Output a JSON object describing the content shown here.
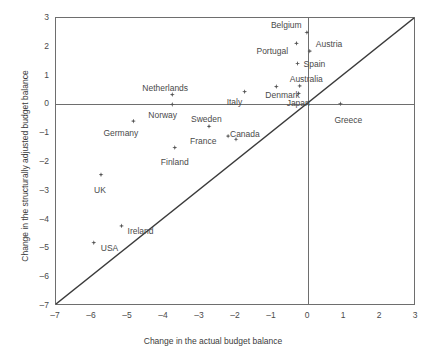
{
  "chart_data": {
    "type": "scatter",
    "title": "",
    "xlabel": "Change in the actual budget balance",
    "ylabel": "Change in the structurally adjusted budget balance",
    "xlim": [
      -7,
      3
    ],
    "ylim": [
      -7,
      3
    ],
    "xticks": [
      "-7",
      "-6",
      "-5",
      "-4",
      "-3",
      "-2",
      "-1",
      "0",
      "1",
      "2",
      "3"
    ],
    "yticks": [
      "3",
      "2",
      "1",
      "0",
      "-1",
      "-2",
      "-3",
      "-4",
      "-5",
      "-6",
      "-7"
    ],
    "grid": false,
    "legend": null,
    "reference_line": {
      "type": "identity",
      "from": [
        -7,
        -7
      ],
      "to": [
        3,
        3
      ]
    },
    "marker_color": "#545454",
    "axis_color": "#6e6e6e",
    "points": [
      {
        "name": "Belgium",
        "x": -0.03,
        "y": 2.5,
        "label_dx": -36,
        "label_dy": -11
      },
      {
        "name": "Austria",
        "x": 0.05,
        "y": 1.85,
        "label_dx": 6,
        "label_dy": -11
      },
      {
        "name": "Portugal",
        "x": -0.32,
        "y": 2.12,
        "label_dx": -40,
        "label_dy": 4
      },
      {
        "name": "Spain",
        "x": -0.29,
        "y": 1.42,
        "label_dx": 6,
        "label_dy": -4
      },
      {
        "name": "Australia",
        "x": -0.23,
        "y": 0.64,
        "label_dx": -10,
        "label_dy": -11
      },
      {
        "name": "Denmark",
        "x": -0.88,
        "y": 0.62,
        "label_dx": -11,
        "label_dy": 4
      },
      {
        "name": "Japan",
        "x": -0.26,
        "y": 0.38,
        "label_dx": -12,
        "label_dy": 6
      },
      {
        "name": "Italy",
        "x": -1.76,
        "y": 0.44,
        "label_dx": -18,
        "label_dy": 6
      },
      {
        "name": "Greece",
        "x": 0.9,
        "y": 0.02,
        "label_dx": -6,
        "label_dy": 12
      },
      {
        "name": "Netherlands",
        "x": -3.77,
        "y": 0.34,
        "label_dx": -30,
        "label_dy": -11
      },
      {
        "name": "Norway",
        "x": -3.77,
        "y": 0.0,
        "label_dx": -24,
        "label_dy": 7
      },
      {
        "name": "Germany",
        "x": -4.85,
        "y": -0.58,
        "label_dx": -30,
        "label_dy": 8
      },
      {
        "name": "Sweden",
        "x": -2.75,
        "y": -0.76,
        "label_dx": -18,
        "label_dy": -11
      },
      {
        "name": "France",
        "x": -2.22,
        "y": -1.1,
        "label_dx": -38,
        "label_dy": 1
      },
      {
        "name": "Canada",
        "x": -2.0,
        "y": -1.21,
        "label_dx": -6,
        "label_dy": -9
      },
      {
        "name": "Finland",
        "x": -3.7,
        "y": -1.5,
        "label_dx": -14,
        "label_dy": 10
      },
      {
        "name": "UK",
        "x": -5.75,
        "y": -2.44,
        "label_dx": -7,
        "label_dy": 11
      },
      {
        "name": "Ireland",
        "x": -5.18,
        "y": -4.22,
        "label_dx": 6,
        "label_dy": 1
      },
      {
        "name": "USA",
        "x": -5.95,
        "y": -4.8,
        "label_dx": 7,
        "label_dy": 1
      }
    ]
  }
}
